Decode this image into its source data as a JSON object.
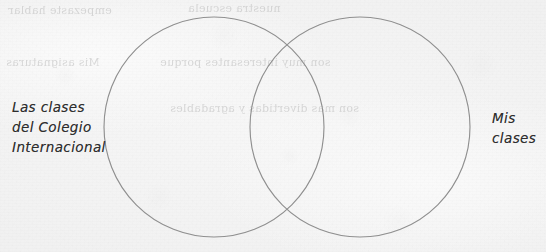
{
  "document": {
    "kind": "handwritten-venn-diagram-worksheet",
    "paper_color": "#f3f3f3",
    "ink_color": "#2e2e2e",
    "line_color": "#8a8a8a"
  },
  "diagram": {
    "type": "venn",
    "circles": [
      {
        "id": "left",
        "cx": 214,
        "cy": 127,
        "r": 110,
        "label_ref": "labels.left"
      },
      {
        "id": "right",
        "cx": 360,
        "cy": 127,
        "r": 110,
        "label_ref": "labels.right"
      }
    ]
  },
  "labels": {
    "left": "Las clases\ndel Colegio\nInternacional",
    "right": "Mis\nclases"
  },
  "bleed_through": {
    "note": "faint mirrored text showing through from the reverse side of the page",
    "lines": [
      {
        "text": "empezaste hablar",
        "left": 8,
        "top": 4,
        "width": 180
      },
      {
        "text": "nuestra escuela",
        "left": 188,
        "top": 2,
        "width": 170
      },
      {
        "text": "Mis asignaturas",
        "left": 6,
        "top": 56,
        "width": 150
      },
      {
        "text": "son muy interesantes porque",
        "left": 160,
        "top": 56,
        "width": 250
      },
      {
        "text": "son mas divertidas y agradables",
        "left": 170,
        "top": 102,
        "width": 260
      }
    ]
  }
}
